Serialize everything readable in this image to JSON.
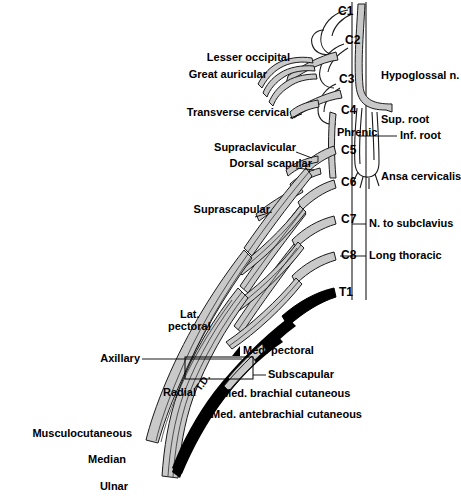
{
  "figure": {
    "colors": {
      "background": "#ffffff",
      "nerve_fill": "#c9c9c9",
      "nerve_outline": "#1a1a1a",
      "medial_black": "#000000",
      "leader_line": "#000000"
    }
  },
  "roots": [
    {
      "name": "C1",
      "x": 338,
      "y": 11
    },
    {
      "name": "C2",
      "x": 345,
      "y": 40
    },
    {
      "name": "C3",
      "x": 339,
      "y": 79
    },
    {
      "name": "C4",
      "x": 341,
      "y": 110
    },
    {
      "name": "C5",
      "x": 341,
      "y": 150
    },
    {
      "name": "C6",
      "x": 341,
      "y": 182
    },
    {
      "name": "C7",
      "x": 341,
      "y": 219
    },
    {
      "name": "C8",
      "x": 341,
      "y": 255
    },
    {
      "name": "T1",
      "x": 339,
      "y": 292
    }
  ],
  "labels_left": [
    {
      "text": "Lesser occipital",
      "x": 175,
      "y": 58,
      "w": 115
    },
    {
      "text": "Great auricular",
      "x": 152,
      "y": 75,
      "w": 115
    },
    {
      "text": "Transverse cervical",
      "x": 161,
      "y": 113,
      "w": 128
    },
    {
      "text": "Supraclavicular",
      "x": 192,
      "y": 148,
      "w": 104
    },
    {
      "text": "Dorsal scapular",
      "x": 208,
      "y": 164,
      "w": 104
    },
    {
      "text": "Suprascapular",
      "x": 166,
      "y": 210,
      "w": 104
    },
    {
      "text": "Axillary",
      "x": 86,
      "y": 359,
      "w": 54
    },
    {
      "text": "Radial",
      "x": 152,
      "y": 393,
      "w": 44
    },
    {
      "text": "Musculocutaneous",
      "x": 8,
      "y": 434,
      "w": 124
    },
    {
      "text": "Median",
      "x": 74,
      "y": 460,
      "w": 52
    },
    {
      "text": "Ulnar",
      "x": 88,
      "y": 487,
      "w": 40
    }
  ],
  "labels_inner": [
    {
      "text": "Phrenic",
      "x": 337,
      "y": 133
    },
    {
      "text": "Lat.",
      "x": 180,
      "y": 315
    },
    {
      "text": "pectoral",
      "x": 168,
      "y": 327
    },
    {
      "text": "T.D.",
      "x": 212,
      "y": 375
    }
  ],
  "labels_right": [
    {
      "text": "Hypoglossal n.",
      "x": 381,
      "y": 76
    },
    {
      "text": "Sup. root",
      "x": 381,
      "y": 120
    },
    {
      "text": "Inf. root",
      "x": 400,
      "y": 136
    },
    {
      "text": "Ansa cervicalis",
      "x": 381,
      "y": 177
    },
    {
      "text": "N. to subclavius",
      "x": 369,
      "y": 224
    },
    {
      "text": "Long thoracic",
      "x": 369,
      "y": 256
    },
    {
      "text": "Med. pectoral",
      "x": 243,
      "y": 351
    },
    {
      "text": "Subscapular",
      "x": 243,
      "y": 375
    },
    {
      "text": "Med. brachial cutaneous",
      "x": 222,
      "y": 394
    },
    {
      "text": "Med. antebrachial cutaneous",
      "x": 211,
      "y": 415
    }
  ]
}
